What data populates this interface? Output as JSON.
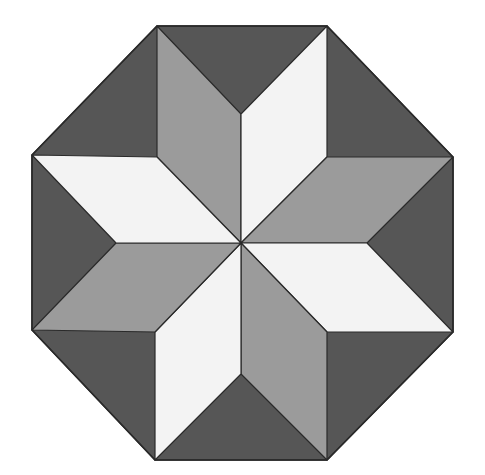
{
  "diagram": {
    "title": "",
    "colors": {
      "background": "#ffffff",
      "dark": "#565656",
      "mid": "#9b9b9b",
      "light": "#f3f3f3",
      "stroke": "#2a2a2a"
    },
    "center": [
      241,
      243
    ],
    "octagon": [
      [
        157,
        26
      ],
      [
        327,
        26
      ],
      [
        453,
        157
      ],
      [
        453,
        332
      ],
      [
        327,
        460
      ],
      [
        155,
        460
      ],
      [
        32,
        330
      ],
      [
        32,
        155
      ]
    ],
    "rhombi": [
      {
        "name": "rhombus-up-left",
        "tone": "mid",
        "points": [
          [
            241,
            243
          ],
          [
            157,
            157
          ],
          [
            157,
            26
          ],
          [
            241,
            114
          ]
        ]
      },
      {
        "name": "rhombus-up-right",
        "tone": "light",
        "points": [
          [
            241,
            243
          ],
          [
            241,
            114
          ],
          [
            327,
            26
          ],
          [
            327,
            157
          ]
        ]
      },
      {
        "name": "rhombus-right-upper",
        "tone": "mid",
        "points": [
          [
            241,
            243
          ],
          [
            327,
            157
          ],
          [
            453,
            157
          ],
          [
            367,
            243
          ]
        ]
      },
      {
        "name": "rhombus-right-lower",
        "tone": "light",
        "points": [
          [
            241,
            243
          ],
          [
            367,
            243
          ],
          [
            453,
            332
          ],
          [
            327,
            332
          ]
        ]
      },
      {
        "name": "rhombus-down-right",
        "tone": "mid",
        "points": [
          [
            241,
            243
          ],
          [
            327,
            332
          ],
          [
            327,
            460
          ],
          [
            241,
            374
          ]
        ]
      },
      {
        "name": "rhombus-down-left",
        "tone": "light",
        "points": [
          [
            241,
            243
          ],
          [
            241,
            374
          ],
          [
            155,
            460
          ],
          [
            155,
            332
          ]
        ]
      },
      {
        "name": "rhombus-left-lower",
        "tone": "mid",
        "points": [
          [
            241,
            243
          ],
          [
            155,
            332
          ],
          [
            32,
            330
          ],
          [
            116,
            243
          ]
        ]
      },
      {
        "name": "rhombus-left-upper",
        "tone": "light",
        "points": [
          [
            241,
            243
          ],
          [
            116,
            243
          ],
          [
            32,
            155
          ],
          [
            157,
            157
          ]
        ]
      }
    ]
  }
}
